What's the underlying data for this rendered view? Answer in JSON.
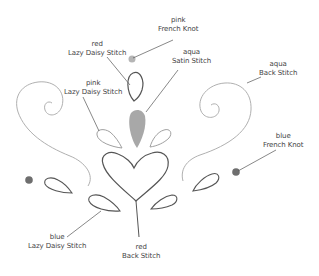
{
  "colors": {
    "outline": "#555555",
    "light_outline": "#b0b0b0",
    "fill_satin": "#a8a8a8",
    "knot_light": "#b5b5b5",
    "knot_dark": "#6e6e6e",
    "leader": "#555555",
    "text": "#444444"
  },
  "labels": [
    {
      "id": "pink-french-knot",
      "color": "pink",
      "stitch": "French Knot"
    },
    {
      "id": "red-lazy-daisy",
      "color": "red",
      "stitch": "Lazy Daisy Stitch"
    },
    {
      "id": "aqua-satin",
      "color": "aqua",
      "stitch": "Satin Stitch"
    },
    {
      "id": "pink-lazy-daisy",
      "color": "pink",
      "stitch": "Lazy Daisy Stitch"
    },
    {
      "id": "aqua-back-stitch",
      "color": "aqua",
      "stitch": "Back Stitch"
    },
    {
      "id": "blue-french-knot",
      "color": "blue",
      "stitch": "French Knot"
    },
    {
      "id": "blue-lazy-daisy",
      "color": "blue",
      "stitch": "Lazy Daisy Stitch"
    },
    {
      "id": "red-back-stitch",
      "color": "red",
      "stitch": "Back Stitch"
    }
  ]
}
